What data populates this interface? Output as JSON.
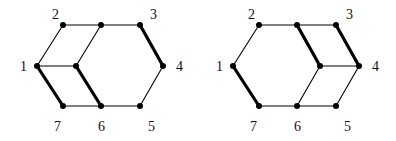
{
  "graphs": [
    {
      "id": "left",
      "vertices": [
        {
          "label": "2",
          "x": 63,
          "y": 25,
          "lx": 52,
          "ly": 19
        },
        {
          "label": "",
          "x": 101,
          "y": 25
        },
        {
          "label": "3",
          "x": 140,
          "y": 25,
          "lx": 150,
          "ly": 19
        },
        {
          "label": "1",
          "x": 37,
          "y": 66,
          "lx": 20,
          "ly": 71
        },
        {
          "label": "",
          "x": 76,
          "y": 66
        },
        {
          "label": "4",
          "x": 163,
          "y": 66,
          "lx": 176,
          "ly": 71
        },
        {
          "label": "7",
          "x": 63,
          "y": 106,
          "lx": 54,
          "ly": 131
        },
        {
          "label": "6",
          "x": 101,
          "y": 106,
          "lx": 98,
          "ly": 131
        },
        {
          "label": "5",
          "x": 140,
          "y": 106,
          "lx": 148,
          "ly": 131
        }
      ],
      "edges": [
        {
          "a": 0,
          "b": 1,
          "bold": false
        },
        {
          "a": 1,
          "b": 2,
          "bold": false
        },
        {
          "a": 2,
          "b": 5,
          "bold": true
        },
        {
          "a": 5,
          "b": 8,
          "bold": false
        },
        {
          "a": 8,
          "b": 7,
          "bold": false
        },
        {
          "a": 7,
          "b": 6,
          "bold": false
        },
        {
          "a": 6,
          "b": 3,
          "bold": true
        },
        {
          "a": 3,
          "b": 0,
          "bold": false
        },
        {
          "a": 3,
          "b": 4,
          "bold": false
        },
        {
          "a": 4,
          "b": 1,
          "bold": false
        },
        {
          "a": 4,
          "b": 7,
          "bold": true
        }
      ]
    },
    {
      "id": "right",
      "vertices": [
        {
          "label": "2",
          "x": 259,
          "y": 25,
          "lx": 248,
          "ly": 19
        },
        {
          "label": "",
          "x": 297,
          "y": 25
        },
        {
          "label": "3",
          "x": 336,
          "y": 25,
          "lx": 346,
          "ly": 19
        },
        {
          "label": "1",
          "x": 233,
          "y": 66,
          "lx": 216,
          "ly": 71
        },
        {
          "label": "",
          "x": 320,
          "y": 66
        },
        {
          "label": "4",
          "x": 359,
          "y": 66,
          "lx": 372,
          "ly": 71
        },
        {
          "label": "7",
          "x": 259,
          "y": 106,
          "lx": 250,
          "ly": 131
        },
        {
          "label": "6",
          "x": 297,
          "y": 106,
          "lx": 294,
          "ly": 131
        },
        {
          "label": "5",
          "x": 336,
          "y": 106,
          "lx": 344,
          "ly": 131
        }
      ],
      "edges": [
        {
          "a": 0,
          "b": 1,
          "bold": false
        },
        {
          "a": 1,
          "b": 2,
          "bold": false
        },
        {
          "a": 2,
          "b": 5,
          "bold": true
        },
        {
          "a": 5,
          "b": 8,
          "bold": false
        },
        {
          "a": 8,
          "b": 7,
          "bold": false
        },
        {
          "a": 7,
          "b": 6,
          "bold": false
        },
        {
          "a": 6,
          "b": 3,
          "bold": true
        },
        {
          "a": 3,
          "b": 0,
          "bold": false
        },
        {
          "a": 1,
          "b": 4,
          "bold": true
        },
        {
          "a": 4,
          "b": 5,
          "bold": false
        },
        {
          "a": 4,
          "b": 7,
          "bold": false
        }
      ]
    }
  ]
}
